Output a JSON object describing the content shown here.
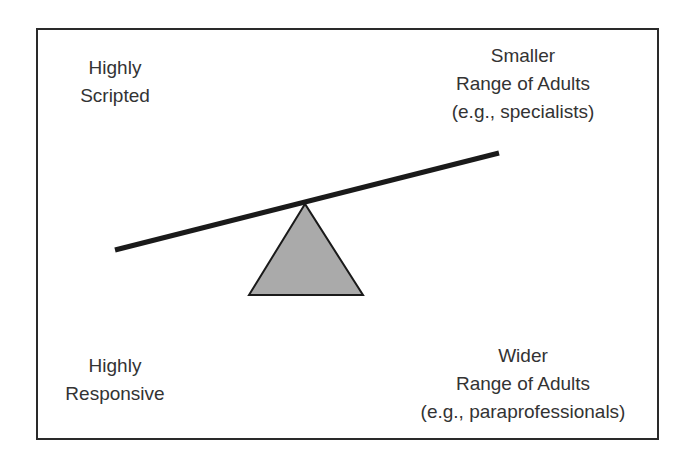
{
  "diagram": {
    "type": "seesaw-balance",
    "colors": {
      "border": "#2a2a2a",
      "beam": "#1a1a1a",
      "fulcrum_fill": "#aaaaaa",
      "fulcrum_stroke": "#1a1a1a",
      "text": "#333333"
    },
    "labels": {
      "top_left": {
        "line1": "Highly",
        "line2": "Scripted"
      },
      "top_right": {
        "line1": "Smaller",
        "line2": "Range of Adults",
        "line3": "(e.g., specialists)"
      },
      "bottom_left": {
        "line1": "Highly",
        "line2": "Responsive"
      },
      "bottom_right": {
        "line1": "Wider",
        "line2": "Range of Adults",
        "line3": "(e.g., paraprofessionals)"
      }
    }
  }
}
